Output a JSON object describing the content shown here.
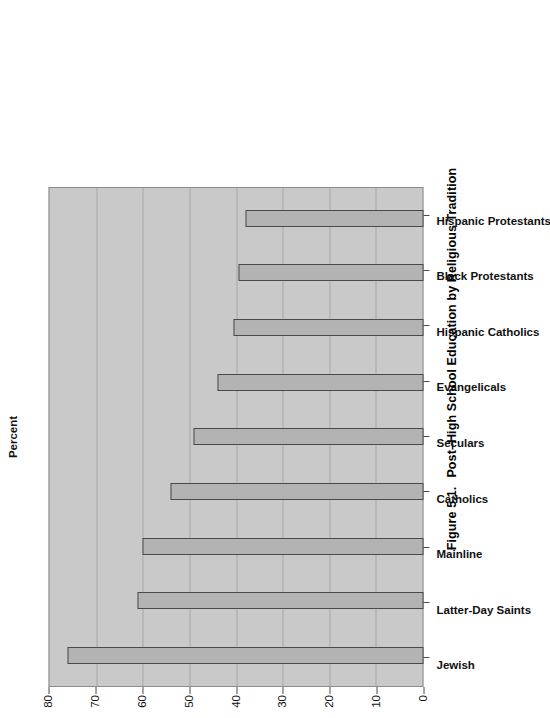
{
  "figure": {
    "caption_number": "Figure 5.1.",
    "caption_text": "Post–High School Education by Religious Tradition"
  },
  "chart_data": {
    "type": "bar",
    "title": "",
    "xlabel": "",
    "ylabel": "Percent",
    "ylim": [
      0,
      80
    ],
    "ytick_step": 10,
    "yticks": [
      "0",
      "10",
      "20",
      "30",
      "40",
      "50",
      "60",
      "70",
      "80"
    ],
    "grid": true,
    "legend": "none",
    "orientation": "vertical-bars-rotated-page",
    "categories": [
      "Jewish",
      "Latter-Day Saints",
      "Mainline",
      "Catholics",
      "Seculars",
      "Evangelicals",
      "Hispanic Catholics",
      "Black Protestants",
      "Hispanic Protestants"
    ],
    "values": [
      76,
      61,
      60,
      54,
      49,
      44,
      40.5,
      39.5,
      38
    ],
    "series": [
      {
        "name": "Percent with post–high school education",
        "values": [
          76,
          61,
          60,
          54,
          49,
          44,
          40.5,
          39.5,
          38
        ]
      }
    ]
  },
  "colors": {
    "plot_background": "#c9c9c9",
    "bar_fill": "#b3b3b3",
    "bar_border": "#4a4a4a",
    "gridline": "#a8a8a8",
    "page_background": "#ffffff",
    "text": "#111111"
  }
}
